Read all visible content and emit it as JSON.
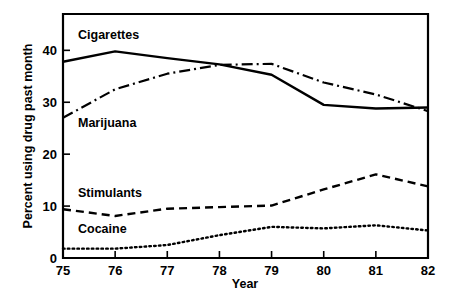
{
  "chart_data": {
    "type": "line",
    "title": "",
    "xlabel": "Year",
    "ylabel": "Percent using drug past month",
    "x": [
      75,
      76,
      77,
      78,
      79,
      80,
      81,
      82
    ],
    "xtick_labels": [
      "75",
      "76",
      "77",
      "78",
      "79",
      "80",
      "81",
      "82"
    ],
    "ytick_labels": [
      "0",
      "10",
      "20",
      "30",
      "40"
    ],
    "yticks": [
      0,
      10,
      20,
      30,
      40
    ],
    "xlim": [
      75,
      82
    ],
    "ylim": [
      0,
      47
    ],
    "grid": false,
    "legend": "inline-labels",
    "series": [
      {
        "name": "Cigarettes",
        "style": "solid",
        "values": [
          37.8,
          39.8,
          38.5,
          37.3,
          35.3,
          29.5,
          28.8,
          29.0
        ],
        "label_x": 78,
        "label_y": 43
      },
      {
        "name": "Marijuana",
        "style": "dash-dot",
        "values": [
          27.0,
          32.5,
          35.5,
          37.2,
          37.4,
          33.8,
          31.5,
          28.3
        ],
        "label_x": 78,
        "label_y": 26
      },
      {
        "name": "Stimulants",
        "style": "dashed",
        "values": [
          9.4,
          8.1,
          9.5,
          9.8,
          10.1,
          13.2,
          16.1,
          13.8
        ],
        "label_x": 78,
        "label_y": 12.5
      },
      {
        "name": "Cocaine",
        "style": "dotted",
        "values": [
          1.8,
          1.8,
          2.5,
          4.4,
          6.0,
          5.7,
          6.3,
          5.3
        ],
        "label_x": 78,
        "label_y": 5.5
      }
    ]
  },
  "colors": {
    "ink": "#000000",
    "background": "#ffffff"
  }
}
